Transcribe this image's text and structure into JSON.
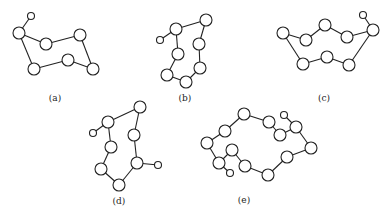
{
  "figures": [
    {
      "label": "(a)",
      "lx": 55,
      "ly": 101,
      "nodes": [
        [
          31,
          16,
          3.5
        ],
        [
          19,
          33,
          6
        ],
        [
          46,
          44,
          6
        ],
        [
          80,
          35,
          6
        ],
        [
          34,
          69,
          6
        ],
        [
          68,
          60,
          6
        ],
        [
          93,
          69,
          6
        ]
      ],
      "edges": [
        [
          0,
          1
        ],
        [
          1,
          2
        ],
        [
          2,
          3
        ],
        [
          3,
          6
        ],
        [
          6,
          5
        ],
        [
          5,
          4
        ],
        [
          4,
          1
        ]
      ]
    },
    {
      "label": "(b)",
      "lx": 185,
      "ly": 101,
      "nodes": [
        [
          160,
          40,
          3.5
        ],
        [
          176,
          29,
          6
        ],
        [
          206,
          20,
          6
        ],
        [
          199,
          44,
          6
        ],
        [
          178,
          54,
          6
        ],
        [
          200,
          68,
          6
        ],
        [
          167,
          75,
          6
        ],
        [
          186,
          82,
          6
        ]
      ],
      "edges": [
        [
          0,
          1
        ],
        [
          1,
          2
        ],
        [
          2,
          3
        ],
        [
          3,
          5
        ],
        [
          5,
          7
        ],
        [
          7,
          6
        ],
        [
          6,
          4
        ],
        [
          4,
          1
        ]
      ]
    },
    {
      "label": "(c)",
      "lx": 324,
      "ly": 101,
      "nodes": [
        [
          363,
          15,
          3.5
        ],
        [
          283,
          33,
          6
        ],
        [
          306,
          40,
          6
        ],
        [
          325,
          25,
          6
        ],
        [
          347,
          37,
          6
        ],
        [
          373,
          30,
          6
        ],
        [
          303,
          64,
          6
        ],
        [
          327,
          57,
          6
        ],
        [
          349,
          65,
          6
        ]
      ],
      "edges": [
        [
          0,
          5
        ],
        [
          1,
          2
        ],
        [
          2,
          3
        ],
        [
          3,
          4
        ],
        [
          4,
          5
        ],
        [
          5,
          8
        ],
        [
          8,
          7
        ],
        [
          7,
          6
        ],
        [
          6,
          1
        ]
      ]
    },
    {
      "label": "(d)",
      "lx": 119,
      "ly": 204,
      "nodes": [
        [
          93,
          133,
          3.5
        ],
        [
          108,
          122,
          6
        ],
        [
          140,
          107,
          6
        ],
        [
          134,
          135,
          6
        ],
        [
          111,
          147,
          6
        ],
        [
          158,
          165,
          3.5
        ],
        [
          137,
          163,
          6
        ],
        [
          101,
          169,
          6
        ],
        [
          119,
          185,
          6
        ]
      ],
      "edges": [
        [
          0,
          1
        ],
        [
          1,
          2
        ],
        [
          2,
          3
        ],
        [
          3,
          6
        ],
        [
          6,
          5
        ],
        [
          6,
          8
        ],
        [
          8,
          7
        ],
        [
          7,
          4
        ],
        [
          4,
          1
        ]
      ]
    },
    {
      "label": "(e)",
      "lx": 244,
      "ly": 203,
      "nodes": [
        [
          244,
          114,
          6
        ],
        [
          269,
          122,
          6
        ],
        [
          284,
          115,
          3.5
        ],
        [
          296,
          127,
          6
        ],
        [
          280,
          135,
          6
        ],
        [
          311,
          148,
          6
        ],
        [
          287,
          157,
          6
        ],
        [
          268,
          175,
          6
        ],
        [
          245,
          166,
          6
        ],
        [
          232,
          150,
          6
        ],
        [
          230,
          173,
          3.5
        ],
        [
          219,
          163,
          6
        ],
        [
          207,
          143,
          6
        ],
        [
          225,
          131,
          6
        ]
      ],
      "edges": [
        [
          0,
          1
        ],
        [
          1,
          4
        ],
        [
          4,
          3
        ],
        [
          2,
          3
        ],
        [
          3,
          5
        ],
        [
          5,
          6
        ],
        [
          6,
          7
        ],
        [
          7,
          8
        ],
        [
          8,
          9
        ],
        [
          9,
          11
        ],
        [
          11,
          10
        ],
        [
          11,
          12
        ],
        [
          12,
          13
        ],
        [
          13,
          0
        ]
      ]
    }
  ]
}
